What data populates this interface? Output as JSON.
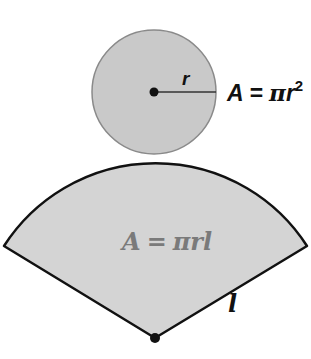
{
  "diagram": {
    "circle": {
      "label_radius": "r",
      "formula": "A = πr²",
      "formula_parts": {
        "lhs": "A",
        "eq": "=",
        "pi": "π",
        "var": "r",
        "exp": "2"
      },
      "fill": "#c9c9c9",
      "stroke": "#8a8a8a"
    },
    "sector": {
      "formula": "A = πrl",
      "formula_parts": {
        "lhs": "A",
        "eq": "=",
        "pi": "π",
        "var1": "r",
        "var2": "l"
      },
      "label_slant": "l",
      "fill": "#d4d4d4",
      "stroke": "#111111",
      "formula_color": "#7a7a7a"
    }
  }
}
